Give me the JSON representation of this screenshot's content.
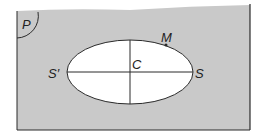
{
  "diagram": {
    "plane_label": "P",
    "center_label": "C",
    "vertex_right_label": "S",
    "vertex_left_label": "S′",
    "point_label": "M",
    "colors": {
      "plane_fill": "#c9c9c9",
      "ellipse_fill": "#ffffff",
      "stroke": "#2a2a2a"
    }
  }
}
